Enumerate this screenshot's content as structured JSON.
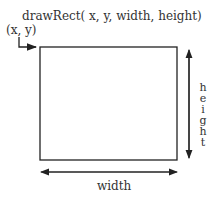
{
  "diagram": {
    "title": "drawRect( x, y, width, height)",
    "origin_label": "(x, y)",
    "width_label": "width",
    "height_label": "height",
    "height_letters": [
      "h",
      "e",
      "i",
      "g",
      "h",
      "t"
    ],
    "colors": {
      "stroke": "#222222",
      "text": "#333333",
      "background": "#ffffff"
    }
  }
}
